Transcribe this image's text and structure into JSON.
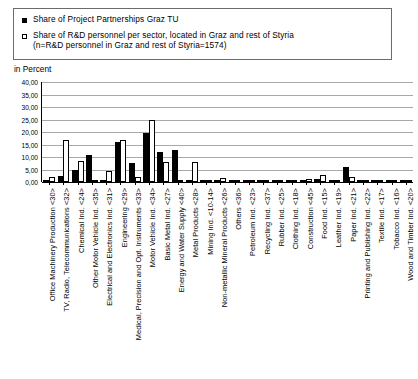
{
  "legend": {
    "items": [
      {
        "marker": "filled-square-marker",
        "label": "Share of Project Partnerships Graz TU"
      },
      {
        "marker": "hollow-square-marker",
        "label": "Share of R&D personnel per sector, located in Graz and rest of Styria"
      }
    ],
    "note": "(n=R&D personnel in Graz and rest of Styria=1574)"
  },
  "axis": {
    "unit_label": "in Percent"
  },
  "chart_data": {
    "type": "bar",
    "title": "",
    "xlabel": "",
    "ylabel": "in Percent",
    "ylim": [
      0,
      40
    ],
    "yticks": [
      0,
      5,
      10,
      15,
      20,
      25,
      30,
      35,
      40
    ],
    "ytick_labels": [
      "0,00",
      "5,00",
      "10,00",
      "15,00",
      "20,00",
      "25,00",
      "30,00",
      "35,00",
      "40,00"
    ],
    "grid": true,
    "legend_position": "top",
    "categories": [
      "Office Machinery Production <30>",
      "TV, Radio, Telecommunications <32>",
      "Chemical Ind.  <24>",
      "Other Motor Vehicle Ind. <35>",
      "Electrical and Electronics Ind.  <31>",
      "Engineering <29>",
      "Medical, Precision and Opt. Instruments <33>",
      "Motor Vehicle Ind.  <34>",
      "Basic Metal Ind.  <27>",
      "Energy and Water Supply <40>",
      "Metal Products <28>",
      "Mining Ind. <10-14>",
      "Non-metallic Mineral Products <26>",
      "Others <36>",
      "Petroleum Ind. <23>",
      "Recycling Ind.  <37>",
      "Rubber Ind.  <25>",
      "Clothing Ind. <18>",
      "Construction <45>",
      "Food Ind. <15>",
      "Leather Ind. <19>",
      "Paper Ind. <21>",
      "Printing and Publishing Ind. <22>",
      "Textile Ind. <17>",
      "Tobacco Ind. <16>",
      "Wood and Timber Ind. <20>"
    ],
    "series": [
      {
        "name": "Share of Project Partnerships Graz TU",
        "color": "#000000",
        "values": [
          1.0,
          2.5,
          5.0,
          11.0,
          0.0,
          16.0,
          7.5,
          19.5,
          12.0,
          13.0,
          1.0,
          0.7,
          0.0,
          0.0,
          0.0,
          0.3,
          0.4,
          0.3,
          0.6,
          1.1,
          0.0,
          6.0,
          0.3,
          0.0,
          0.0,
          0.2
        ]
      },
      {
        "name": "Share of R&D personnel per sector, located in Graz and rest of Styria",
        "color": "#ffffff",
        "values": [
          2.2,
          17.0,
          8.5,
          0.4,
          4.5,
          17.0,
          2.0,
          25.0,
          8.0,
          0.0,
          8.0,
          0.3,
          1.7,
          0.2,
          0.0,
          0.0,
          0.6,
          0.0,
          1.1,
          2.7,
          0.0,
          2.0,
          0.0,
          1.0,
          0.0,
          0.3
        ]
      }
    ]
  }
}
